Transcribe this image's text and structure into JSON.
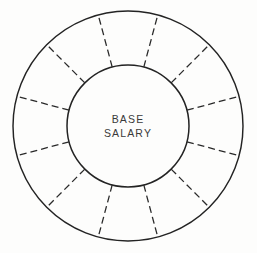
{
  "canvas": {
    "width": 257,
    "height": 253,
    "background_color": "#fdfdfc"
  },
  "diagram": {
    "name": "base-salary-wheel",
    "type": "segmented-ring",
    "line_color": "#232323",
    "spoke_color": "#2a2a2a",
    "fill_color": "none",
    "center": {
      "x": 128,
      "y": 126
    },
    "outer_radius": 115,
    "inner_radius": 61,
    "segment_count": 12,
    "spoke_style": "dashed",
    "circle_style": "solid",
    "spoke_angles_deg": [
      15,
      45,
      75,
      105,
      135,
      165,
      195,
      225,
      255,
      285,
      315,
      345
    ],
    "segment_center_angles_deg": [
      0,
      30,
      60,
      90,
      120,
      150,
      180,
      210,
      240,
      270,
      300,
      330
    ],
    "segment_labels": [
      "",
      "",
      "",
      "",
      "",
      "",
      "",
      "",
      "",
      "",
      "",
      ""
    ]
  },
  "center_label": {
    "name": "base-salary-label",
    "line1": "BASE",
    "line2": "SALARY",
    "text_color": "#3a3a3a"
  },
  "chart_data": {
    "type": "pie",
    "title": "",
    "subtitle": "",
    "xlabel": "",
    "ylabel": "",
    "center_text": "BASE SALARY",
    "categories": [
      "segment-1",
      "segment-2",
      "segment-3",
      "segment-4",
      "segment-5",
      "segment-6",
      "segment-7",
      "segment-8",
      "segment-9",
      "segment-10",
      "segment-11",
      "segment-12"
    ],
    "values": [
      8.333,
      8.333,
      8.333,
      8.333,
      8.333,
      8.333,
      8.333,
      8.333,
      8.333,
      8.333,
      8.333,
      8.333
    ],
    "unit": "percent",
    "legend": [],
    "legend_position": "none",
    "grid": false,
    "annotations": [
      "BASE",
      "SALARY"
    ]
  }
}
